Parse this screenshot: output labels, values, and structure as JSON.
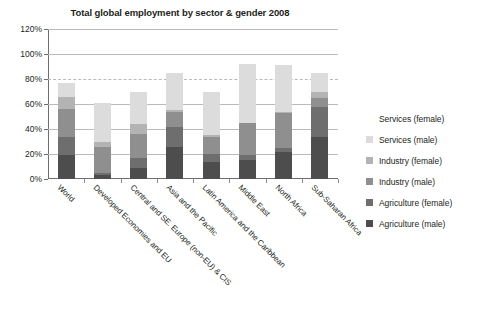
{
  "chart_data": {
    "type": "bar",
    "stacked": true,
    "title": "Total global employment by sector & gender 2008",
    "xlabel": "",
    "ylabel": "",
    "ylim": [
      0,
      120
    ],
    "ytick_labels": [
      "0%",
      "20%",
      "40%",
      "60%",
      "80%",
      "100%",
      "120%"
    ],
    "ytick_values": [
      0,
      20,
      40,
      60,
      80,
      100,
      120
    ],
    "grid": true,
    "legend_position": "right",
    "categories": [
      "World",
      "Developed Economies and EU",
      "Central and SE. Europe (non-EU) & CIS",
      "Asia and the Pacific",
      "Latin America and the Caribbean",
      "Middle East",
      "North Africa",
      "Sub-Saharan Africa"
    ],
    "series": [
      {
        "name": "Agriculture (male)",
        "color": "#4d4d4d",
        "values": [
          19,
          3,
          9,
          26,
          14,
          15,
          22,
          34
        ]
      },
      {
        "name": "Agriculture (female)",
        "color": "#6e6e6e",
        "values": [
          15,
          2,
          8,
          16,
          6,
          4,
          3,
          24
        ]
      },
      {
        "name": "Industry (male)",
        "color": "#8f8f8f",
        "values": [
          22,
          21,
          19,
          12,
          14,
          26,
          28,
          7
        ]
      },
      {
        "name": "Industry (female)",
        "color": "#b3b3b3",
        "values": [
          10,
          4,
          8,
          1,
          1,
          0,
          1,
          5
        ]
      },
      {
        "name": "Services (male)",
        "color": "#dcdcdc",
        "values": [
          11,
          31,
          26,
          30,
          35,
          47,
          37,
          15
        ]
      },
      {
        "name": "Services (female)",
        "color": "#ffffff",
        "values": [
          0,
          0,
          0,
          0,
          0,
          0,
          0,
          0
        ]
      }
    ],
    "totals": [
      77,
      61,
      70,
      85,
      70,
      92,
      91,
      85
    ]
  },
  "legend": {
    "items": [
      {
        "label": "Services (female)",
        "color": "#ffffff"
      },
      {
        "label": "Services (male)",
        "color": "#dcdcdc"
      },
      {
        "label": "Industry (female)",
        "color": "#b3b3b3"
      },
      {
        "label": "Industry (male)",
        "color": "#8f8f8f"
      },
      {
        "label": "Agriculture (female)",
        "color": "#6e6e6e"
      },
      {
        "label": "Agriculture (male)",
        "color": "#4d4d4d"
      }
    ]
  }
}
